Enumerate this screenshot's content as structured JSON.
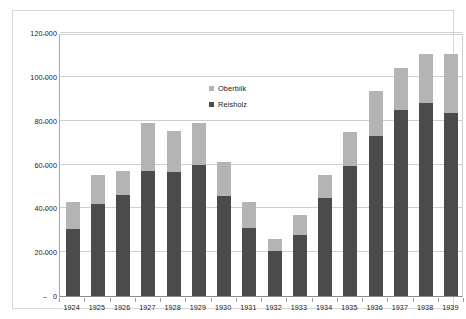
{
  "chart_data": {
    "type": "bar",
    "subtype": "stacked-column",
    "title": "",
    "subtitle": "",
    "xlabel": "",
    "ylabel": "",
    "categories": [
      "1924",
      "1925",
      "1926",
      "1927",
      "1928",
      "1929",
      "1930",
      "1931",
      "1932",
      "1933",
      "1934",
      "1935",
      "1936",
      "1937",
      "1938",
      "1939"
    ],
    "series": [
      {
        "name": "Reisholz",
        "color": "#4b4b4b",
        "values": [
          30500,
          42000,
          46000,
          57000,
          56500,
          60000,
          45500,
          31000,
          20500,
          28000,
          44500,
          59500,
          73000,
          85000,
          88000,
          83500
        ]
      },
      {
        "name": "Oberbilk",
        "color": "#b4b4b4",
        "values": [
          12500,
          13000,
          11000,
          22000,
          19000,
          19000,
          15500,
          12000,
          5500,
          9000,
          10500,
          15500,
          20500,
          19000,
          22500,
          27000
        ]
      }
    ],
    "totals": [
      43000,
      55000,
      57000,
      79000,
      75500,
      79000,
      61000,
      43000,
      26000,
      37000,
      55000,
      75000,
      93500,
      104000,
      110500,
      110500
    ],
    "ylim": [
      0,
      120000
    ],
    "ytick_values": [
      0,
      20000,
      40000,
      60000,
      80000,
      100000,
      120000
    ],
    "ytick_labels": [
      "0",
      "20.000",
      "40.000",
      "60.000",
      "80.000",
      "100.000",
      "120.000"
    ],
    "grid": true,
    "legend_position": "inside-top-center",
    "legend_entries": [
      "Oberbilk",
      "Reisholz"
    ]
  },
  "legend": {
    "items": [
      {
        "label": "Oberbilk",
        "color": "#b4b4b4"
      },
      {
        "label": "Reisholz",
        "color": "#4b4b4b"
      }
    ]
  },
  "colors": {
    "reisholz": "#4b4b4b",
    "oberbilk": "#b4b4b4",
    "gridline": "#d0d0d0",
    "axis": "#8c8c8c",
    "frame": "#d8d8d8",
    "text": "#1a1a1a",
    "background": "#ffffff"
  }
}
